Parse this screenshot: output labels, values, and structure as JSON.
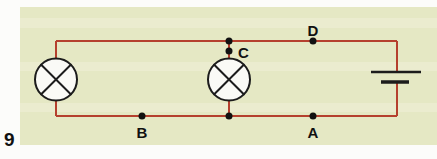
{
  "figure": {
    "number": "9"
  },
  "colors": {
    "panel_bg": "#e5e8c4",
    "panel_band": "#f1f2de",
    "wire": "#b5402e",
    "component_stroke": "#1c1c1c",
    "node_dot": "#111111"
  },
  "circuit": {
    "nodes": {
      "a": "A",
      "b": "B",
      "c": "C",
      "d": "D"
    },
    "components": {
      "lamp_left": "lamp",
      "lamp_middle": "lamp",
      "battery": "cell"
    }
  }
}
